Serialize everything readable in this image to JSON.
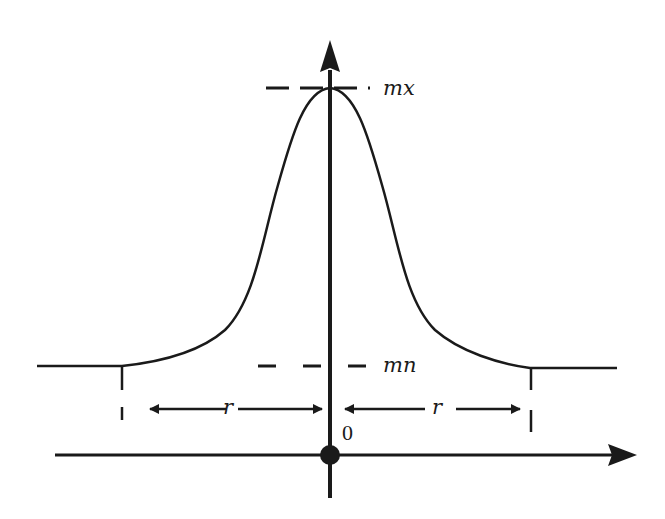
{
  "diagram": {
    "type": "gaussian-profile",
    "labels": {
      "max": "mx",
      "min": "mn",
      "radius_left": "r",
      "radius_right": "r",
      "origin": "0"
    },
    "colors": {
      "stroke": "#1a1a1a",
      "background": "#ffffff"
    },
    "elements": [
      "vertical axis with upward arrow",
      "horizontal axis with rightward arrow",
      "origin dot",
      "bell curve peaking at mx",
      "dashed line at mx level",
      "dashed line at mn level",
      "flat baseline tails",
      "vertical tick marks at ±r",
      "double-sided r arrows from ticks to center"
    ]
  }
}
